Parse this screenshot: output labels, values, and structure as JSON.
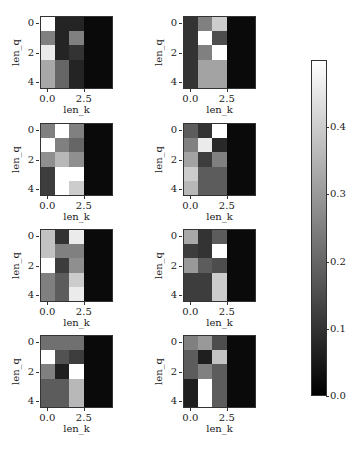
{
  "chart_data": {
    "type": "heatmap",
    "layout": {
      "rows": 4,
      "cols": 2
    },
    "cmap": "gray",
    "vmin": 0.0,
    "vmax": 0.5,
    "colorbar": {
      "ticks": [
        "0.0",
        "0.1",
        "0.2",
        "0.3",
        "0.4"
      ]
    },
    "panels": [
      {
        "xlabel": "len_k",
        "ylabel": "len_q",
        "xticks": [
          "0.0",
          "2.5"
        ],
        "yticks": [
          "0",
          "2",
          "4"
        ],
        "values": [
          [
            0.5,
            0.07,
            0.07,
            0.02,
            0.02
          ],
          [
            0.25,
            0.07,
            0.25,
            0.02,
            0.02
          ],
          [
            0.46,
            0.07,
            0.1,
            0.02,
            0.02
          ],
          [
            0.33,
            0.2,
            0.07,
            0.02,
            0.02
          ],
          [
            0.33,
            0.2,
            0.07,
            0.02,
            0.02
          ]
        ]
      },
      {
        "xlabel": "len_k",
        "ylabel": "len_q",
        "xticks": [
          "0.0",
          "2.5"
        ],
        "yticks": [
          "0",
          "2",
          "4"
        ],
        "values": [
          [
            0.1,
            0.25,
            0.4,
            0.02,
            0.02
          ],
          [
            0.1,
            0.5,
            0.15,
            0.02,
            0.02
          ],
          [
            0.1,
            0.25,
            0.5,
            0.02,
            0.02
          ],
          [
            0.1,
            0.32,
            0.32,
            0.02,
            0.02
          ],
          [
            0.1,
            0.32,
            0.32,
            0.02,
            0.02
          ]
        ]
      },
      {
        "xlabel": "len_k",
        "ylabel": "len_q",
        "xticks": [
          "0.0",
          "2.5"
        ],
        "yticks": [
          "0",
          "2",
          "4"
        ],
        "values": [
          [
            0.25,
            0.5,
            0.25,
            0.02,
            0.02
          ],
          [
            0.5,
            0.25,
            0.2,
            0.02,
            0.02
          ],
          [
            0.28,
            0.36,
            0.28,
            0.02,
            0.02
          ],
          [
            0.12,
            0.5,
            0.5,
            0.02,
            0.02
          ],
          [
            0.12,
            0.5,
            0.4,
            0.02,
            0.02
          ]
        ]
      },
      {
        "xlabel": "len_k",
        "ylabel": "len_q",
        "xticks": [
          "0.0",
          "2.5"
        ],
        "yticks": [
          "0",
          "2",
          "4"
        ],
        "values": [
          [
            0.18,
            0.1,
            0.5,
            0.02,
            0.02
          ],
          [
            0.25,
            0.46,
            0.08,
            0.02,
            0.02
          ],
          [
            0.32,
            0.12,
            0.25,
            0.02,
            0.02
          ],
          [
            0.4,
            0.18,
            0.18,
            0.02,
            0.02
          ],
          [
            0.36,
            0.18,
            0.18,
            0.02,
            0.02
          ]
        ]
      },
      {
        "xlabel": "len_k",
        "ylabel": "len_q",
        "xticks": [
          "0.0",
          "2.5"
        ],
        "yticks": [
          "0",
          "2",
          "4"
        ],
        "values": [
          [
            0.38,
            0.1,
            0.46,
            0.02,
            0.02
          ],
          [
            0.38,
            0.25,
            0.25,
            0.02,
            0.02
          ],
          [
            0.5,
            0.12,
            0.28,
            0.02,
            0.02
          ],
          [
            0.25,
            0.18,
            0.4,
            0.02,
            0.02
          ],
          [
            0.25,
            0.18,
            0.46,
            0.02,
            0.02
          ]
        ]
      },
      {
        "xlabel": "len_k",
        "ylabel": "len_q",
        "xticks": [
          "0.0",
          "2.5"
        ],
        "yticks": [
          "0",
          "2",
          "4"
        ],
        "values": [
          [
            0.33,
            0.1,
            0.18,
            0.02,
            0.02
          ],
          [
            0.12,
            0.1,
            0.5,
            0.02,
            0.02
          ],
          [
            0.3,
            0.18,
            0.15,
            0.02,
            0.02
          ],
          [
            0.12,
            0.12,
            0.4,
            0.02,
            0.02
          ],
          [
            0.12,
            0.12,
            0.4,
            0.02,
            0.02
          ]
        ]
      },
      {
        "xlabel": "len_k",
        "ylabel": "len_q",
        "xticks": [
          "0.0",
          "2.5"
        ],
        "yticks": [
          "0",
          "2",
          "4"
        ],
        "values": [
          [
            0.22,
            0.22,
            0.22,
            0.02,
            0.02
          ],
          [
            0.5,
            0.16,
            0.12,
            0.02,
            0.02
          ],
          [
            0.25,
            0.06,
            0.5,
            0.02,
            0.02
          ],
          [
            0.18,
            0.18,
            0.36,
            0.02,
            0.02
          ],
          [
            0.18,
            0.18,
            0.36,
            0.02,
            0.02
          ]
        ]
      },
      {
        "xlabel": "len_k",
        "ylabel": "len_q",
        "xticks": [
          "0.0",
          "2.5"
        ],
        "yticks": [
          "0",
          "2",
          "4"
        ],
        "values": [
          [
            0.25,
            0.3,
            0.15,
            0.02,
            0.02
          ],
          [
            0.18,
            0.06,
            0.38,
            0.02,
            0.02
          ],
          [
            0.18,
            0.25,
            0.18,
            0.02,
            0.02
          ],
          [
            0.06,
            0.5,
            0.18,
            0.02,
            0.02
          ],
          [
            0.06,
            0.5,
            0.18,
            0.02,
            0.02
          ]
        ]
      }
    ]
  }
}
